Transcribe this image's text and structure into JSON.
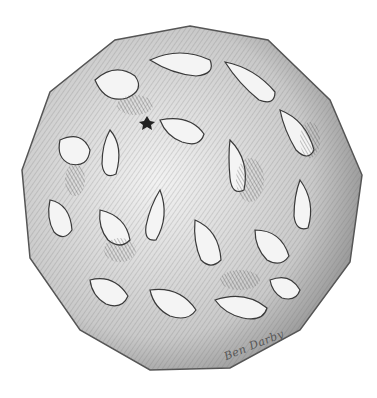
{
  "artwork": {
    "subject": "pen-and-ink stippled/hatched drawing of an icosahedral pollen grain covered in brain-like rugulate ridges",
    "signature": "Ben Darby",
    "colors": {
      "background": "#ffffff",
      "ink": "#3a3a3a",
      "mid": "#8a8a8a",
      "light": "#d8d8d8"
    }
  }
}
